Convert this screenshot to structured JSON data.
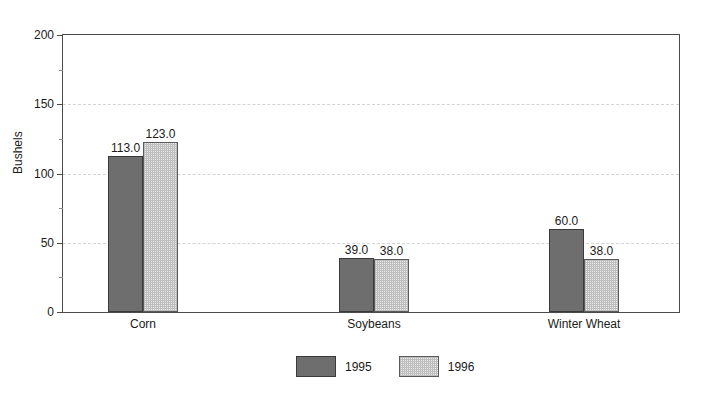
{
  "chart_data": {
    "type": "bar",
    "title": "",
    "xlabel": "",
    "ylabel": "Bushels",
    "ylim": [
      0,
      200
    ],
    "yticks": [
      0,
      50,
      100,
      150,
      200
    ],
    "ytick_labels": [
      "0",
      "50",
      "100",
      "150",
      "200"
    ],
    "yticks_minor": [
      25,
      75,
      125,
      175
    ],
    "grid": true,
    "grid_axis": "y",
    "legend_position": "bottom-center",
    "categories": [
      "Corn",
      "Soybeans",
      "Winter Wheat"
    ],
    "series": [
      {
        "name": "1995",
        "color": "#6e6e6e",
        "values": [
          113.0,
          39.0,
          60.0
        ],
        "labels": [
          "113.0",
          "39.0",
          "60.0"
        ]
      },
      {
        "name": "1996",
        "color": "#ededed",
        "values": [
          123.0,
          38.0,
          38.0
        ],
        "labels": [
          "123.0",
          "38.0",
          "38.0"
        ]
      }
    ]
  },
  "axis": {
    "y_title": "Bushels",
    "tick_labels": [
      "200",
      "150",
      "100",
      "50",
      "0"
    ]
  },
  "legend": {
    "entries": [
      {
        "label": "1995"
      },
      {
        "label": "1996"
      }
    ]
  }
}
